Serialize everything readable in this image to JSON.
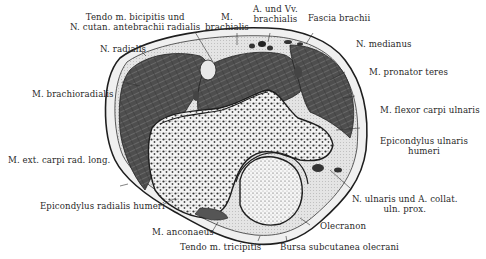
{
  "figure": {
    "colors": {
      "muscle": "#4a4a4a",
      "muscle_light": "#6a6a6a",
      "skin": "#ededed",
      "fat": "#d8d8d8",
      "bone": "#f2f2f2",
      "bone_spongy": "#3a3a3a",
      "ink": "#1e1e1e"
    }
  },
  "labels": {
    "tendo_biceps_l1": "Tendo m. bicipitis und",
    "tendo_biceps_l2": "N. cutan. antebrachii radialis",
    "brachialis_l1": "M.",
    "brachialis_l2": "brachialis",
    "a_vv_l1": "A. und Vv.",
    "a_vv_l2": "brachialis",
    "fascia": "Fascia brachii",
    "n_radialis": "N. radialis",
    "n_medianus": "N. medianus",
    "pronator": "M. pronator teres",
    "brachioradialis": "M. brachioradialis",
    "flexor": "M. flexor carpi ulnaris",
    "ext_carpi": "M. ext. carpi rad. long.",
    "epi_uln_l1": "Epicondylus ulnaris",
    "epi_uln_l2": "humeri",
    "n_ulnaris_l1": "N. ulnaris und A. collat.",
    "n_ulnaris_l2": "uln. prox.",
    "epi_rad": "Epicondylus radialis humeri",
    "olecranon": "Olecranon",
    "anconaeus": "M. anconaeus",
    "tendo_tri": "Tendo m. tricipitis",
    "bursa": "Bursa subcutanea olecrani"
  }
}
